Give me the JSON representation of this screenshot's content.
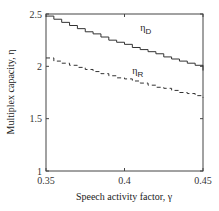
{
  "chart_data": {
    "type": "line",
    "title": "",
    "xlabel": "Speech activity factor, γ",
    "ylabel": "Multiplex capacity, η",
    "xlim": [
      0.35,
      0.45
    ],
    "ylim": [
      1,
      2.5
    ],
    "xticks": [
      "0.35",
      "0.4",
      "0.45"
    ],
    "yticks": [
      "1",
      "1.5",
      "2",
      "2.5"
    ],
    "grid": false,
    "series": [
      {
        "name": "η_D",
        "style": "solid step",
        "x": [
          0.35,
          0.355,
          0.36,
          0.365,
          0.37,
          0.375,
          0.38,
          0.385,
          0.39,
          0.395,
          0.4,
          0.405,
          0.41,
          0.415,
          0.42,
          0.425,
          0.43,
          0.435,
          0.44,
          0.445,
          0.45
        ],
        "values": [
          2.48,
          2.45,
          2.42,
          2.39,
          2.36,
          2.33,
          2.31,
          2.28,
          2.25,
          2.23,
          2.21,
          2.18,
          2.16,
          2.14,
          2.12,
          2.09,
          2.07,
          2.05,
          2.03,
          2.01,
          1.96
        ]
      },
      {
        "name": "η_R",
        "style": "dashed step",
        "x": [
          0.35,
          0.355,
          0.36,
          0.365,
          0.37,
          0.375,
          0.38,
          0.385,
          0.39,
          0.395,
          0.4,
          0.405,
          0.41,
          0.415,
          0.42,
          0.425,
          0.43,
          0.435,
          0.44,
          0.445,
          0.45
        ],
        "values": [
          2.08,
          2.05,
          2.03,
          2.01,
          1.99,
          1.97,
          1.95,
          1.93,
          1.91,
          1.89,
          1.88,
          1.86,
          1.84,
          1.82,
          1.8,
          1.79,
          1.77,
          1.75,
          1.74,
          1.72,
          1.7
        ]
      }
    ],
    "annotations": [
      {
        "text": "η",
        "sub": "D",
        "x": 0.41,
        "y": 2.34
      },
      {
        "text": "η",
        "sub": "R",
        "x": 0.405,
        "y": 1.93
      }
    ]
  }
}
